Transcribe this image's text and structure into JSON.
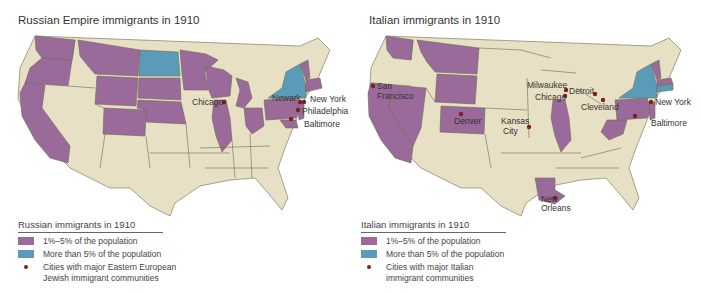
{
  "colors": {
    "land": "#e8e0c4",
    "purple": "#9a6a9a",
    "blue": "#5a9cb8",
    "border": "#6b6b52",
    "city_dot": "#7a1f24"
  },
  "maps": [
    {
      "title": "Russian Empire immigrants in 1910",
      "legend": {
        "title": "Russian immigrants in 1910",
        "items": [
          {
            "type": "swatch",
            "color": "#9a6a9a",
            "label": "1%–5% of the population"
          },
          {
            "type": "swatch",
            "color": "#5a9cb8",
            "label": "More than 5% of the population"
          },
          {
            "type": "dot",
            "label_line1": "Cities with major Eastern European",
            "label_line2": "Jewish immigrant communities"
          }
        ]
      },
      "states_1_5_percent": [
        "Washington",
        "Oregon",
        "California",
        "Montana",
        "Wyoming",
        "South Dakota",
        "Nebraska",
        "Colorado",
        "Minnesota",
        "Wisconsin",
        "Michigan",
        "Illinois",
        "Ohio",
        "Pennsylvania",
        "New Jersey",
        "Connecticut",
        "Massachusetts",
        "Rhode Island",
        "Maryland",
        "Vermont"
      ],
      "states_over_5_percent": [
        "North Dakota",
        "New York"
      ],
      "cities": [
        "Chicago",
        "Newark",
        "New York",
        "Philadelphia",
        "Baltimore"
      ]
    },
    {
      "title": "Italian immigrants in 1910",
      "legend": {
        "title": "Italian immigrants in 1910",
        "items": [
          {
            "type": "swatch",
            "color": "#9a6a9a",
            "label": "1%–5% of the population"
          },
          {
            "type": "swatch",
            "color": "#5a9cb8",
            "label": "More than 5% of the population"
          },
          {
            "type": "dot",
            "label_line1": "Cities with major Italian",
            "label_line2": "immigrant communities"
          }
        ]
      },
      "states_1_5_percent": [
        "Washington",
        "California",
        "Nevada",
        "Montana",
        "Wyoming",
        "Colorado",
        "Illinois",
        "Louisiana",
        "Pennsylvania",
        "West Virginia",
        "New Jersey",
        "Vermont",
        "Massachusetts"
      ],
      "states_over_5_percent": [
        "New York",
        "Connecticut",
        "Rhode Island"
      ],
      "cities": [
        "San Francisco",
        "Denver",
        "Kansas City",
        "Milwaukee",
        "Chicago",
        "Detroit",
        "Cleveland",
        "New York",
        "Baltimore",
        "New Orleans"
      ]
    }
  ]
}
